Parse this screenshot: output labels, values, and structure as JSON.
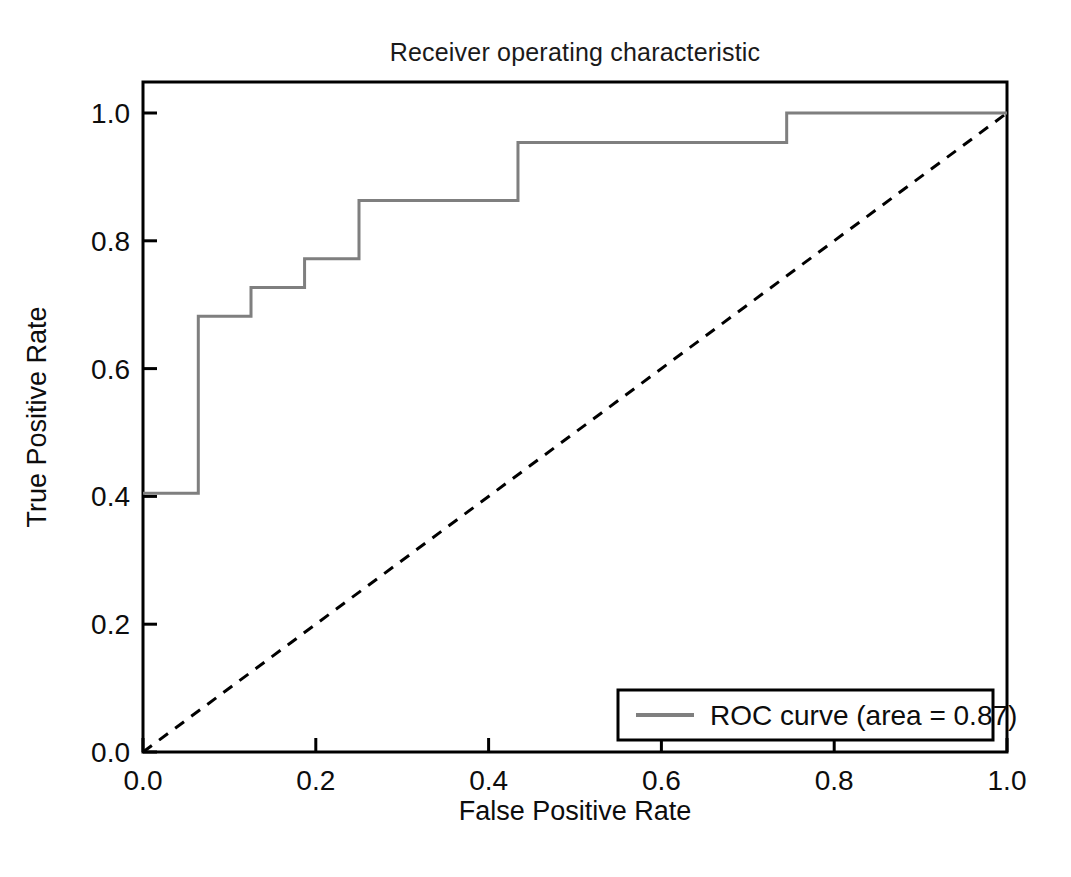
{
  "chart_data": {
    "type": "line",
    "title": "Receiver operating characteristic",
    "xlabel": "False Positive Rate",
    "ylabel": "True Positive Rate",
    "xlim": [
      0.0,
      1.0
    ],
    "ylim": [
      0.0,
      1.0
    ],
    "xticks": [
      "0.0",
      "0.2",
      "0.4",
      "0.6",
      "0.8",
      "1.0"
    ],
    "xtick_values": [
      0.0,
      0.2,
      0.4,
      0.6,
      0.8,
      1.0
    ],
    "yticks": [
      "0.0",
      "0.2",
      "0.4",
      "0.6",
      "0.8",
      "1.0"
    ],
    "ytick_values": [
      0.0,
      0.2,
      0.4,
      0.6,
      0.8,
      1.0
    ],
    "grid": false,
    "legend_position": "lower right",
    "series": [
      {
        "name": "ROC curve (area = 0.87)",
        "style": "step-post",
        "color": "#7f7f7f",
        "linewidth": 2,
        "x": [
          0.0,
          0.064,
          0.064,
          0.125,
          0.125,
          0.187,
          0.187,
          0.25,
          0.25,
          0.434,
          0.434,
          0.745,
          0.745,
          1.0
        ],
        "y": [
          0.405,
          0.405,
          0.682,
          0.682,
          0.727,
          0.727,
          0.772,
          0.772,
          0.863,
          0.863,
          0.954,
          0.954,
          1.0,
          1.0
        ]
      },
      {
        "name": "chance-diagonal",
        "style": "dashed",
        "color": "#000000",
        "linewidth": 2,
        "x": [
          0.0,
          1.0
        ],
        "y": [
          0.0,
          1.0
        ]
      }
    ],
    "annotations": []
  },
  "legend": {
    "entries": [
      {
        "label": "ROC curve (area = 0.87)",
        "color": "#7f7f7f",
        "dash": "solid"
      }
    ]
  },
  "colors": {
    "roc_curve": "#7f7f7f",
    "diagonal": "#000000",
    "axis": "#000000",
    "background": "#ffffff"
  }
}
